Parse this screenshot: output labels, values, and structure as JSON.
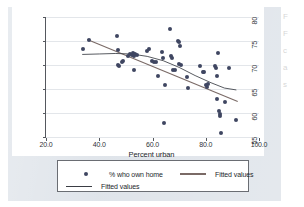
{
  "figure": {
    "background_color": "#dfe4ea",
    "plot_background": "#ffffff"
  },
  "legend": {
    "entries": [
      {
        "marker": "dot",
        "label": "% who own home"
      },
      {
        "marker": "line-thick",
        "label": "Fitted values"
      },
      {
        "marker": "line-thin",
        "label": "Fitted values"
      }
    ]
  },
  "bleed_text": {
    "lines": [
      "F",
      "F",
      "c",
      "a",
      "s"
    ]
  },
  "chart_data": {
    "type": "scatter",
    "title": "",
    "xlabel": "Percent urban",
    "ylabel": "",
    "xlim": [
      20.0,
      100.0
    ],
    "ylim": [
      55,
      80
    ],
    "xticks": [
      20.0,
      40.0,
      60.0,
      80.0,
      100.0
    ],
    "xtick_labels": [
      "20.0",
      "40.0",
      "60.0",
      "80.0",
      "100.0"
    ],
    "yticks": [
      55,
      60,
      65,
      70,
      75,
      80
    ],
    "ytick_labels": [
      "55",
      "60",
      "65",
      "70",
      "75",
      "80"
    ],
    "grid": "horizontal",
    "legend_position": "below-plot",
    "marker_color": "#3f4661",
    "series": [
      {
        "name": "% who own home",
        "type": "scatter",
        "points": [
          [
            33.8,
            73.4
          ],
          [
            36.1,
            75.2
          ],
          [
            46.8,
            76.0
          ],
          [
            47.2,
            73.2
          ],
          [
            47.0,
            70.0
          ],
          [
            47.4,
            69.7
          ],
          [
            48.6,
            70.6
          ],
          [
            49.0,
            70.9
          ],
          [
            50.9,
            71.9
          ],
          [
            51.6,
            72.3
          ],
          [
            52.2,
            72.1
          ],
          [
            52.6,
            72.4
          ],
          [
            53.1,
            71.9
          ],
          [
            53.4,
            72.2
          ],
          [
            52.9,
            69.0
          ],
          [
            54.2,
            72.0
          ],
          [
            57.9,
            73.0
          ],
          [
            58.8,
            73.3
          ],
          [
            59.7,
            70.9
          ],
          [
            60.6,
            70.6
          ],
          [
            61.4,
            70.6
          ],
          [
            61.9,
            67.8
          ],
          [
            63.5,
            72.7
          ],
          [
            64.1,
            71.5
          ],
          [
            64.4,
            58.0
          ],
          [
            64.8,
            65.9
          ],
          [
            66.6,
            77.5
          ],
          [
            66.9,
            71.8
          ],
          [
            67.4,
            71.4
          ],
          [
            67.7,
            69.0
          ],
          [
            68.3,
            68.9
          ],
          [
            69.6,
            74.9
          ],
          [
            70.1,
            74.7
          ],
          [
            70.4,
            73.9
          ],
          [
            70.0,
            70.2
          ],
          [
            70.8,
            70.1
          ],
          [
            73.4,
            65.2
          ],
          [
            73.0,
            67.5
          ],
          [
            77.8,
            69.8
          ],
          [
            79.0,
            68.6
          ],
          [
            79.4,
            68.5
          ],
          [
            80.2,
            65.8
          ],
          [
            80.5,
            65.5
          ],
          [
            80.8,
            66.0
          ],
          [
            83.6,
            69.8
          ],
          [
            84.0,
            69.4
          ],
          [
            84.3,
            67.7
          ],
          [
            84.6,
            72.6
          ],
          [
            84.1,
            63.0
          ],
          [
            84.9,
            60.4
          ],
          [
            85.2,
            59.8
          ],
          [
            85.4,
            59.4
          ],
          [
            85.8,
            55.9
          ],
          [
            87.3,
            62.3
          ],
          [
            88.6,
            69.3
          ],
          [
            91.2,
            58.6
          ]
        ]
      },
      {
        "name": "Fitted values (linear)",
        "type": "line",
        "color": "#7a6a66",
        "points": [
          [
            35.5,
            75.3
          ],
          [
            92.0,
            62.4
          ]
        ]
      },
      {
        "name": "Fitted values (quadratic)",
        "type": "line",
        "color": "#3a3d44",
        "points": [
          [
            33.6,
            72.2
          ],
          [
            40.0,
            72.3
          ],
          [
            46.0,
            72.4
          ],
          [
            52.0,
            72.3
          ],
          [
            58.0,
            71.8
          ],
          [
            64.0,
            70.9
          ],
          [
            70.0,
            69.5
          ],
          [
            76.0,
            67.8
          ],
          [
            82.0,
            66.3
          ],
          [
            87.0,
            65.2
          ],
          [
            91.5,
            64.8
          ]
        ]
      }
    ]
  }
}
